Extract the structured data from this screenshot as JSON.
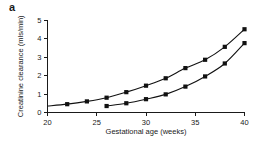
{
  "panel": {
    "label": "a"
  },
  "chart_data": {
    "type": "line",
    "title": "",
    "xlabel": "Gestational age (weeks)",
    "ylabel": "Creatinine clearance (mls/min)",
    "xlim": [
      20,
      40
    ],
    "ylim": [
      0,
      5
    ],
    "xticks": [
      20,
      25,
      30,
      35,
      40
    ],
    "xtick_labels": [
      "20",
      "25",
      "30",
      "35",
      "40"
    ],
    "yticks": [
      0,
      1,
      2,
      3,
      4,
      5
    ],
    "ytick_labels": [
      "0",
      "1",
      "2",
      "3",
      "4",
      "5"
    ],
    "grid": false,
    "legend": false,
    "legend_position": "none",
    "marker": "square",
    "series": [
      {
        "name": "upper-curve",
        "x": [
          20,
          22,
          24,
          26,
          28,
          30,
          32,
          34,
          36,
          38,
          40
        ],
        "values": [
          0.35,
          0.45,
          0.6,
          0.8,
          1.1,
          1.45,
          1.85,
          2.4,
          2.85,
          3.55,
          4.5
        ],
        "marker_x": [
          22,
          24,
          26,
          28,
          30,
          32,
          34,
          36,
          38,
          40
        ],
        "marker_values": [
          0.45,
          0.6,
          0.8,
          1.1,
          1.45,
          1.85,
          2.4,
          2.85,
          3.55,
          4.5
        ]
      },
      {
        "name": "lower-curve",
        "x": [
          26,
          28,
          30,
          32,
          34,
          36,
          38,
          40
        ],
        "values": [
          0.35,
          0.5,
          0.72,
          0.98,
          1.4,
          1.95,
          2.65,
          3.75
        ],
        "marker_x": [
          26,
          28,
          30,
          32,
          34,
          36,
          38,
          40
        ],
        "marker_values": [
          0.35,
          0.5,
          0.72,
          0.98,
          1.4,
          1.95,
          2.65,
          3.75
        ]
      }
    ]
  }
}
